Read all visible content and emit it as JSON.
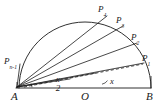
{
  "figure": {
    "type": "geometry-diagram",
    "background_color": "#ffffff",
    "stroke_color": "#1a1a1a",
    "points": [
      {
        "id": "A",
        "label": "A",
        "subscript": "",
        "x": 16,
        "y": 88
      },
      {
        "id": "O",
        "label": "O",
        "subscript": "",
        "x": 85,
        "y": 88
      },
      {
        "id": "B",
        "label": "B",
        "subscript": "",
        "x": 150,
        "y": 88
      },
      {
        "id": "P1",
        "label": "P",
        "subscript": "1",
        "x": 143,
        "y": 62
      },
      {
        "id": "P2",
        "label": "P",
        "subscript": "2",
        "x": 135,
        "y": 41
      },
      {
        "id": "P3",
        "label": "P",
        "subscript": "3",
        "x": 121,
        "y": 24
      },
      {
        "id": "P4",
        "label": "P",
        "subscript": "4",
        "x": 104,
        "y": 13
      },
      {
        "id": "Pn-1",
        "label": "P",
        "subscript": "n-1",
        "x": 14,
        "y": 62
      }
    ],
    "point_labels": [
      {
        "name": "label-P4",
        "text": "P",
        "sub": "4",
        "left": 98,
        "top": 5
      },
      {
        "name": "label-P3",
        "text": "P",
        "sub": "3",
        "left": 116,
        "top": 16
      },
      {
        "name": "label-P2",
        "text": "P",
        "sub": "2",
        "left": 131,
        "top": 33
      },
      {
        "name": "label-P1",
        "text": "P",
        "sub": "1",
        "left": 142,
        "top": 55
      },
      {
        "name": "label-Pn-1",
        "text": "P",
        "sub": "n-1",
        "left": 4,
        "top": 57
      }
    ],
    "vertex_labels": [
      {
        "name": "label-A",
        "text": "A",
        "left": 11,
        "top": 92
      },
      {
        "name": "label-O",
        "text": "O",
        "left": 81,
        "top": 92
      },
      {
        "name": "label-B",
        "text": "B",
        "left": 146,
        "top": 92
      }
    ],
    "angle_labels": [
      {
        "name": "angle-half-x",
        "numerator": "x",
        "denominator": "2",
        "left": 54,
        "top": 76
      },
      {
        "name": "angle-x",
        "text": "x",
        "left": 110,
        "top": 78
      }
    ],
    "segments": [
      {
        "name": "diameter-AB",
        "from": "A",
        "to": "B",
        "style": "solid"
      },
      {
        "name": "ray-A-P1",
        "from": "A",
        "to": "P1",
        "style": "solid"
      },
      {
        "name": "ray-A-P2",
        "from": "A",
        "to": "P2",
        "style": "solid"
      },
      {
        "name": "ray-A-P3",
        "from": "A",
        "to": "P3",
        "style": "solid"
      },
      {
        "name": "ray-A-P4",
        "from": "A",
        "to": "P4",
        "style": "solid"
      },
      {
        "name": "ray-A-Pn-1",
        "from": "A",
        "to": "Pn-1",
        "style": "solid"
      },
      {
        "name": "dashed-A-P1",
        "from": "A",
        "to": "P1",
        "style": "dashed"
      }
    ],
    "arc": {
      "name": "semicircle-arc",
      "center_x": 85,
      "center_y": 88,
      "radius": 66,
      "from_angle_deg": 180,
      "to_angle_deg": 0
    },
    "tick_marks": [
      {
        "name": "tick-at-A",
        "x": 16,
        "y": 88
      },
      {
        "name": "tick-at-B",
        "x": 150,
        "y": 88
      }
    ]
  }
}
